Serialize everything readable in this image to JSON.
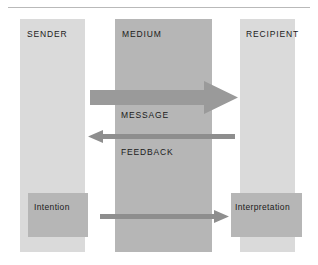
{
  "diagram": {
    "colors": {
      "column_light": "#dadada",
      "column_dark": "#b6b6b6",
      "arrow_thick": "#9a9a9a",
      "arrow_thin": "#8e8e8e",
      "rule": "#b9b9b9",
      "text": "#1a1a1a",
      "background": "#ffffff"
    },
    "columns": [
      {
        "id": "sender",
        "label": "SENDER"
      },
      {
        "id": "medium",
        "label": "MEDIUM"
      },
      {
        "id": "recipient",
        "label": "RECIPIENT"
      }
    ],
    "boxes": [
      {
        "id": "intention",
        "label": "Intention"
      },
      {
        "id": "interpretation",
        "label": "Interpretation"
      }
    ],
    "flows": [
      {
        "id": "message",
        "label": "MESSAGE",
        "direction": "right",
        "weight": "thick"
      },
      {
        "id": "feedback",
        "label": "FEEDBACK",
        "direction": "left",
        "weight": "thin"
      },
      {
        "id": "intention-to-interpretation",
        "label": "",
        "direction": "right",
        "weight": "thin"
      }
    ]
  }
}
